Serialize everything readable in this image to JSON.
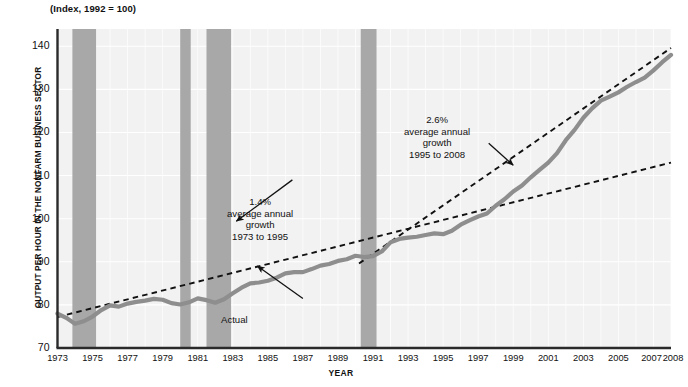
{
  "chart_data": {
    "type": "line",
    "title": "(Index, 1992 = 100)",
    "xlabel": "YEAR",
    "ylabel": "OUTPUT PER HOUR IN THE NONFARM BUSINESS SECTOR",
    "xlim": [
      1973,
      2008
    ],
    "ylim": [
      70,
      144
    ],
    "yticks": [
      70,
      80,
      90,
      100,
      110,
      120,
      130,
      140
    ],
    "xticks": [
      1973,
      1975,
      1977,
      1979,
      1981,
      1983,
      1985,
      1987,
      1989,
      1991,
      1993,
      1995,
      1997,
      1999,
      2001,
      2003,
      2005,
      2007,
      2008
    ],
    "grid": true,
    "legend": "none",
    "series": [
      {
        "name": "Actual",
        "style": "solid",
        "color": "#8e8e8e",
        "x": [
          1973,
          1973.5,
          1974,
          1974.5,
          1975,
          1975.5,
          1976,
          1976.5,
          1977,
          1977.5,
          1978,
          1978.5,
          1979,
          1979.5,
          1980,
          1980.5,
          1981,
          1981.5,
          1982,
          1982.5,
          1983,
          1983.5,
          1984,
          1984.5,
          1985,
          1985.5,
          1986,
          1986.5,
          1987,
          1987.5,
          1988,
          1988.5,
          1989,
          1989.5,
          1990,
          1990.5,
          1991,
          1991.5,
          1992,
          1992.5,
          1993,
          1993.5,
          1994,
          1994.5,
          1995,
          1995.5,
          1996,
          1996.5,
          1997,
          1997.5,
          1998,
          1998.5,
          1999,
          1999.5,
          2000,
          2000.5,
          2001,
          2001.5,
          2002,
          2002.5,
          2003,
          2003.5,
          2004,
          2004.5,
          2005,
          2005.5,
          2006,
          2006.5,
          2007,
          2007.5,
          2008
        ],
        "y": [
          78.0,
          77.0,
          75.6,
          76.2,
          77.3,
          78.8,
          79.9,
          79.6,
          80.3,
          80.7,
          81.0,
          81.4,
          81.2,
          80.4,
          80.1,
          80.6,
          81.5,
          81.1,
          80.5,
          81.3,
          82.7,
          84.0,
          85.0,
          85.2,
          85.6,
          86.3,
          87.3,
          87.6,
          87.6,
          88.3,
          89.1,
          89.5,
          90.2,
          90.6,
          91.4,
          91.1,
          91.3,
          92.4,
          94.5,
          95.3,
          95.6,
          95.8,
          96.2,
          96.6,
          96.4,
          97.2,
          98.6,
          99.6,
          100.5,
          101.2,
          103.0,
          104.5,
          106.3,
          107.7,
          109.6,
          111.3,
          113.0,
          115.2,
          118.2,
          120.6,
          123.4,
          125.6,
          127.4,
          128.3,
          129.3,
          130.6,
          131.7,
          132.7,
          134.4,
          136.3,
          138.0
        ]
      },
      {
        "name": "1.4% average annual growth trend 1973 to 1995",
        "style": "dashed",
        "color": "#111111",
        "x": [
          1973,
          2008
        ],
        "y": [
          77.2,
          113.0
        ]
      },
      {
        "name": "2.6% average annual growth trend 1995 to 2008",
        "style": "dashed",
        "color": "#111111",
        "x": [
          1990.2,
          2008
        ],
        "y": [
          89.6,
          139.6
        ]
      }
    ],
    "shaded_bands": [
      {
        "name": "recession-1973-1975",
        "x0": 1973.85,
        "x1": 1975.2
      },
      {
        "name": "recession-1980",
        "x0": 1980.0,
        "x1": 1980.6
      },
      {
        "name": "recession-1981-1982",
        "x0": 1981.5,
        "x1": 1982.9
      },
      {
        "name": "recession-1990-1991",
        "x0": 1990.3,
        "x1": 1991.2
      }
    ],
    "band_color": "#a8a8a8",
    "plot_bg": "#f2f2f2",
    "annotations": [
      {
        "name": "growth-1973-1995",
        "lines": [
          "1.4%",
          "average annual",
          "growth",
          "1973 to 1995"
        ],
        "arrow_from": [
          1986.4,
          109.0
        ],
        "arrow_to": [
          1983.2,
          99.4
        ]
      },
      {
        "name": "growth-1995-2008",
        "lines": [
          "2.6%",
          "average annual",
          "growth",
          "1995 to 2008"
        ],
        "arrow_from": [
          1997.6,
          117.5
        ],
        "arrow_to": [
          1999.0,
          112.4
        ]
      },
      {
        "name": "actual-label",
        "lines": [
          "Actual"
        ],
        "arrow_from": [
          1987.0,
          81.5
        ],
        "arrow_to": [
          1984.4,
          89.0
        ]
      }
    ]
  },
  "axes": {
    "x_axis_title": "YEAR",
    "y_axis_title": "OUTPUT PER HOUR IN THE NONFARM BUSINESS SECTOR",
    "index_note": "(Index, 1992 = 100)"
  }
}
